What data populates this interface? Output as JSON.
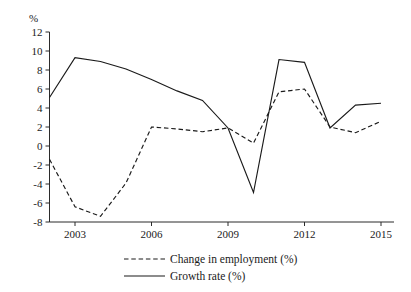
{
  "chart_data": {
    "type": "line",
    "title": "",
    "xlabel": "",
    "ylabel": "%",
    "grid": false,
    "legend_position": "bottom",
    "xlim": [
      2002,
      2015
    ],
    "ylim": [
      -8,
      12
    ],
    "y_ticks": [
      "12",
      "10",
      "8",
      "6",
      "4",
      "2",
      "0",
      "-2",
      "-4",
      "-6",
      "-8"
    ],
    "y_tick_values": [
      12,
      10,
      8,
      6,
      4,
      2,
      0,
      -2,
      -4,
      -6,
      -8
    ],
    "x_ticks": [
      "2003",
      "2006",
      "2009",
      "2012",
      "2015"
    ],
    "x_tick_values": [
      2003,
      2006,
      2009,
      2012,
      2015
    ],
    "x": [
      2002,
      2003,
      2004,
      2005,
      2006,
      2007,
      2008,
      2009,
      2010,
      2011,
      2012,
      2013,
      2014,
      2015
    ],
    "series": [
      {
        "name": "Change in employment (%)",
        "style": "dashed",
        "color": "#1a1a1a",
        "values": [
          -1.4,
          -6.4,
          -7.4,
          -3.9,
          2.0,
          1.8,
          1.5,
          1.9,
          0.3,
          5.7,
          6.0,
          2.0,
          1.4,
          2.6
        ]
      },
      {
        "name": "Growth rate (%)",
        "style": "solid",
        "color": "#1a1a1a",
        "values": [
          5.1,
          9.3,
          8.9,
          8.1,
          7.0,
          5.8,
          4.8,
          1.9,
          -4.9,
          9.1,
          8.8,
          1.9,
          4.3,
          4.5
        ]
      }
    ]
  },
  "legend": {
    "items": [
      {
        "label": "Change in employment (%)",
        "style": "dashed"
      },
      {
        "label": "Growth rate (%)",
        "style": "solid"
      }
    ]
  }
}
